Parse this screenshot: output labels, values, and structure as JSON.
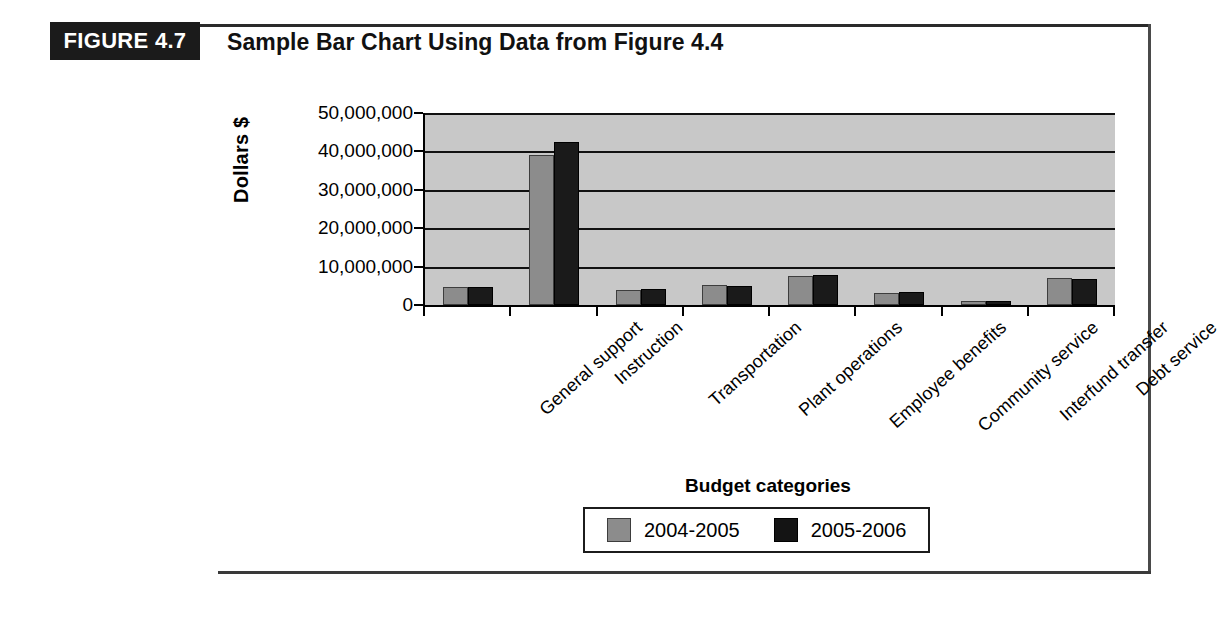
{
  "figure": {
    "tag": "FIGURE 4.7",
    "title": "Sample Bar Chart Using Data from Figure 4.4"
  },
  "legend": {
    "position": "bottom",
    "items": [
      {
        "label": "2004-2005",
        "color": "#8c8c8c"
      },
      {
        "label": "2005-2006",
        "color": "#141414"
      }
    ]
  },
  "chart_data": {
    "type": "bar",
    "title": "Sample Bar Chart Using Data from Figure 4.4",
    "xlabel": "Budget categories",
    "ylabel": "Dollars $",
    "ylim": [
      0,
      50000000
    ],
    "ytick_values": [
      0,
      10000000,
      20000000,
      30000000,
      40000000,
      50000000
    ],
    "ytick_labels": [
      "0",
      "10,000,000",
      "20,000,000",
      "30,000,000",
      "40,000,000",
      "50,000,000"
    ],
    "grid": true,
    "grid_axis": "y",
    "plot_background": "#c8c8c8",
    "categories": [
      "General support",
      "Instruction",
      "Transportation",
      "Plant operations",
      "Employee benefits",
      "Community service",
      "Interfund transfer",
      "Debt service"
    ],
    "series": [
      {
        "name": "2004-2005",
        "color": "#8c8c8c",
        "values": [
          4300000,
          38500000,
          3500000,
          4600000,
          7000000,
          2700000,
          500000,
          6500000
        ]
      },
      {
        "name": "2005-2006",
        "color": "#141414",
        "values": [
          4300000,
          42000000,
          3700000,
          4400000,
          7200000,
          2800000,
          400000,
          6200000
        ]
      }
    ]
  }
}
